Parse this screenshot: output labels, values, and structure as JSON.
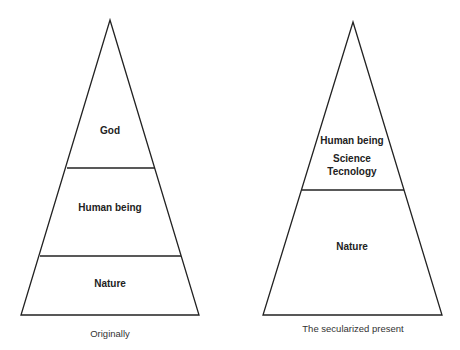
{
  "colors": {
    "stroke": "#222222",
    "text": "#222222",
    "background": "#ffffff"
  },
  "pyramids": [
    {
      "caption": "Originally",
      "layers": [
        {
          "label": "God"
        },
        {
          "label": "Human being"
        },
        {
          "label": "Nature"
        }
      ]
    },
    {
      "caption": "The secularized present",
      "layers": [
        {
          "label": "Human being",
          "sub1": "Science",
          "sub2": "Tecnology"
        },
        {
          "label": "Nature"
        }
      ]
    }
  ]
}
